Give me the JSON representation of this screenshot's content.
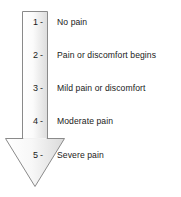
{
  "figure": {
    "arrow_direction": "down",
    "colors": {
      "outline": "#808080",
      "fill_light": "#ffffff",
      "fill_shade": "#e2e2e2",
      "text": "#1a1a1a"
    }
  },
  "scale": {
    "tick_mark": "-",
    "levels": [
      {
        "number": "1",
        "label": "No pain",
        "top": 15
      },
      {
        "number": "2",
        "label": "Pain or discomfort begins",
        "top": 48
      },
      {
        "number": "3",
        "label": "Mild pain or discomfort",
        "top": 81
      },
      {
        "number": "4",
        "label": "Moderate pain",
        "top": 114
      },
      {
        "number": "5",
        "label": "Severe pain",
        "top": 148
      }
    ]
  }
}
